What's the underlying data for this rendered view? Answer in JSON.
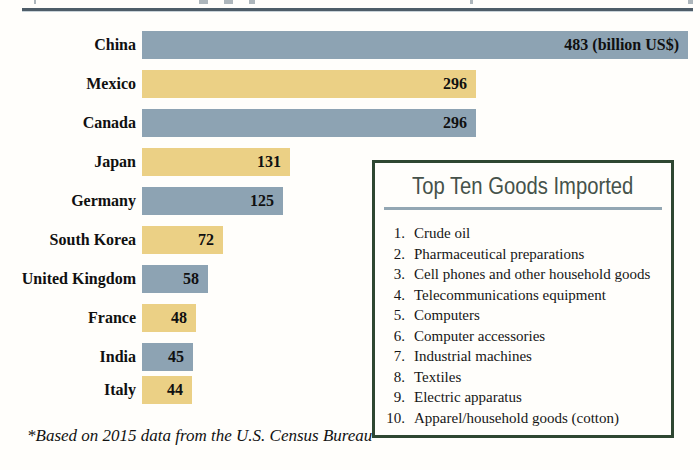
{
  "page": {
    "footnote": "*Based on 2015 data from the U.S. Census Bureau"
  },
  "chart_data": {
    "type": "bar",
    "orientation": "horizontal",
    "unit": "billion US$",
    "categories": [
      "China",
      "Mexico",
      "Canada",
      "Japan",
      "Germany",
      "South Korea",
      "United Kingdom",
      "France",
      "India",
      "Italy"
    ],
    "values": [
      483,
      296,
      296,
      131,
      125,
      72,
      58,
      48,
      45,
      44
    ],
    "value_labels": [
      "483 (billion US$)",
      "296",
      "296",
      "131",
      "125",
      "72",
      "58",
      "48",
      "45",
      "44"
    ],
    "bar_color_pattern": [
      "#8da3b3",
      "#ebd085"
    ],
    "xlim": [
      0,
      495
    ],
    "grid": false,
    "legend": false
  },
  "goods_box": {
    "title": "Top Ten Goods Imported",
    "items": [
      "Crude oil",
      "Pharmaceutical preparations",
      "Cell phones and other household goods",
      "Telecommunications equipment",
      "Computers",
      "Computer accessories",
      "Industrial machines",
      "Textiles",
      "Electric apparatus",
      "Apparel/household goods (cotton)"
    ]
  },
  "colors": {
    "bar_blue": "#8da3b3",
    "bar_yellow": "#ebd085",
    "box_border_green": "#2e4731",
    "box_title_text": "#45524a",
    "title_divider_blue": "#93a7b3",
    "top_rule": "#4e5d68"
  }
}
